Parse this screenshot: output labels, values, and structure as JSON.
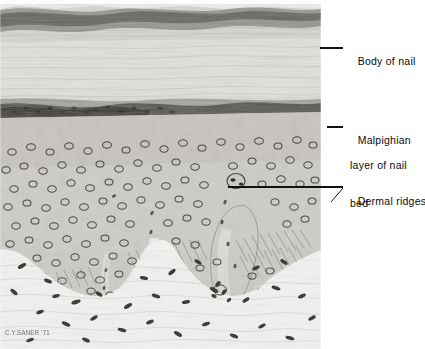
{
  "figure": {
    "kind": "histology-photomicrograph",
    "width": 425,
    "height": 349,
    "plate_width": 321,
    "background_color": "#ffffff"
  },
  "signature": {
    "text": "C.Y.SANER '71"
  },
  "labels": [
    {
      "id": "body-of-nail",
      "lines": [
        "Body of nail"
      ],
      "x": 345,
      "y": 42,
      "leader": {
        "type": "horizontal",
        "x1": 320,
        "y1": 48,
        "x2": 343,
        "y2": 48
      }
    },
    {
      "id": "malpighian",
      "lines": [
        "Malpighian",
        "layer of nail",
        "bed"
      ],
      "x": 345,
      "y": 121,
      "leader": {
        "type": "horizontal",
        "x1": 327,
        "y1": 127,
        "x2": 343,
        "y2": 127
      }
    },
    {
      "id": "dermal-ridges",
      "lines": [
        "Dermal ridges"
      ],
      "x": 345,
      "y": 182,
      "leader": {
        "type": "horizontal-plus-tick",
        "x1": 228,
        "y1": 187,
        "x2": 343,
        "y2": 187,
        "tx1": 343,
        "ty1": 188,
        "tx2": 332,
        "ty2": 201
      }
    }
  ],
  "structures": {
    "body_of_nail": {
      "label": "Body of nail",
      "y_top": 3,
      "y_bottom": 100,
      "description": "keratinized striated nail plate"
    },
    "malpighian_layer": {
      "label": "Malpighian layer of nail bed",
      "y_top": 100,
      "y_bottom": 265,
      "description": "stratified squamous epithelium with round nuclei"
    },
    "dermal_ridges": {
      "label": "Dermal ridges",
      "y_top": 170,
      "y_bottom": 300,
      "description": "interdigitating dermal papillae"
    },
    "dermis": {
      "label": "Dermis",
      "y_top": 265,
      "y_bottom": 349,
      "description": "loose connective tissue with spindle fibroblast nuclei"
    }
  },
  "colors": {
    "leader_line": "#111111",
    "label_text": "#0d0d0d",
    "plate_light": "#eceae7",
    "plate_mid": "#b9b6b1",
    "plate_dark": "#5b5954",
    "nucleus": "#3a3835",
    "page_background": "#ffffff"
  }
}
